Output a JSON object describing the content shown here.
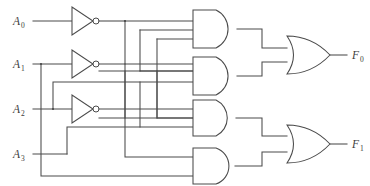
{
  "diagram": {
    "background_color": "#ffffff",
    "line_color": "#4a4a4a",
    "text_color": "#3b3b3b"
  },
  "inputs": [
    {
      "name": "A0",
      "base": "A",
      "sub": "0"
    },
    {
      "name": "A1",
      "base": "A",
      "sub": "1"
    },
    {
      "name": "A2",
      "base": "A",
      "sub": "2"
    },
    {
      "name": "A3",
      "base": "A",
      "sub": "3"
    }
  ],
  "outputs": [
    {
      "name": "F0",
      "base": "F",
      "sub": "0"
    },
    {
      "name": "F1",
      "base": "F",
      "sub": "1"
    }
  ],
  "gates": {
    "inverters": [
      {
        "id": "inv-a0",
        "label": "NOT",
        "input": "A0"
      },
      {
        "id": "inv-a1",
        "label": "NOT",
        "input": "A1"
      },
      {
        "id": "inv-a2",
        "label": "NOT",
        "input": "A2"
      }
    ],
    "and_gates": [
      {
        "id": "and-1",
        "label": "AND",
        "input_count": 3
      },
      {
        "id": "and-2",
        "label": "AND",
        "input_count": 3
      },
      {
        "id": "and-3",
        "label": "AND",
        "input_count": 3
      },
      {
        "id": "and-4",
        "label": "AND",
        "input_count": 2
      }
    ],
    "or_gates": [
      {
        "id": "or-f0",
        "label": "OR",
        "input_count": 2,
        "output": "F0"
      },
      {
        "id": "or-f1",
        "label": "OR",
        "input_count": 2,
        "output": "F1"
      }
    ]
  }
}
